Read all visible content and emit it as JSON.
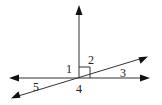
{
  "diagram": {
    "type": "intersecting-lines-angles",
    "colors": {
      "line": "#333333",
      "arrowhead": "#111111",
      "label": "#222222",
      "background": "#ffffff"
    },
    "lines": [
      {
        "id": "vertical-ray",
        "kind": "ray",
        "direction": "up"
      },
      {
        "id": "horizontal-line",
        "kind": "line",
        "direction": "left-right"
      },
      {
        "id": "slanted-line",
        "kind": "line",
        "direction": "lower-left to upper-right"
      }
    ],
    "right_angle_marker": {
      "between": [
        "vertical-ray",
        "horizontal-line"
      ],
      "quadrant": "upper-right"
    },
    "angle_labels": [
      {
        "id": "1",
        "text": "1",
        "position": "upper-left of intersection"
      },
      {
        "id": "2",
        "text": "2",
        "position": "upper-right, between vertical ray and slanted line"
      },
      {
        "id": "3",
        "text": "3",
        "position": "right, between slanted line and horizontal line"
      },
      {
        "id": "4",
        "text": "4",
        "position": "below intersection"
      },
      {
        "id": "5",
        "text": "5",
        "position": "left, between horizontal line and slanted line"
      }
    ]
  }
}
